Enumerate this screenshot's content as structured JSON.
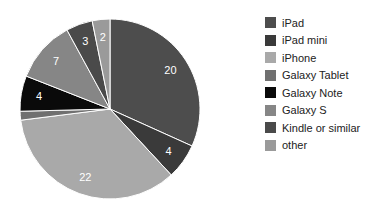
{
  "chart_data": {
    "type": "pie",
    "title": "",
    "slices": [
      {
        "label": "iPad",
        "value": 20,
        "color": "#4d4d4d",
        "show_label": true
      },
      {
        "label": "iPad mini",
        "value": 4,
        "color": "#3a3a3a",
        "show_label": true
      },
      {
        "label": "iPhone",
        "value": 22,
        "color": "#a9a9a9",
        "show_label": true
      },
      {
        "label": "Galaxy Tablet",
        "value": 1,
        "color": "#707070",
        "show_label": false
      },
      {
        "label": "Galaxy Note",
        "value": 4,
        "color": "#0a0a0a",
        "show_label": true
      },
      {
        "label": "Galaxy S",
        "value": 7,
        "color": "#868686",
        "show_label": true
      },
      {
        "label": "Kindle or similar",
        "value": 3,
        "color": "#4a4a4a",
        "show_label": true
      },
      {
        "label": "other",
        "value": 2,
        "color": "#9a9a9a",
        "show_label": true
      }
    ],
    "legend": {
      "position": "right"
    }
  }
}
